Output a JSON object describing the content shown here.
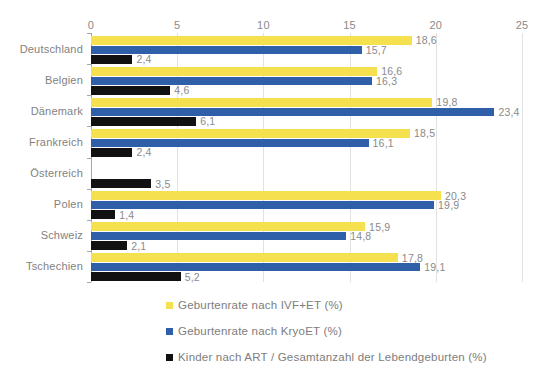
{
  "chart_data": {
    "type": "bar",
    "orientation": "horizontal",
    "title": "",
    "xlabel": "",
    "ylabel": "",
    "xlim": [
      0,
      25
    ],
    "xticks": [
      0,
      5,
      10,
      15,
      20,
      25
    ],
    "xtick_labels": [
      "0",
      "5",
      "10",
      "15",
      "20",
      "25"
    ],
    "grid": true,
    "legend_position": "bottom-left",
    "decimal_separator": ",",
    "categories": [
      "Deutschland",
      "Belgien",
      "Dänemark",
      "Frankreich",
      "Österreich",
      "Polen",
      "Schweiz",
      "Tschechien"
    ],
    "series": [
      {
        "name": "Geburtenrate nach IVF+ET (%)",
        "color": "#f5e04f",
        "values": [
          18.6,
          16.6,
          19.8,
          18.5,
          null,
          20.3,
          15.9,
          17.8
        ],
        "labels": [
          "18,6",
          "16,6",
          "19,8",
          "18,5",
          "",
          "20,3",
          "15,9",
          "17,8"
        ]
      },
      {
        "name": "Geburtenrate nach KryoET (%)",
        "color": "#2e5fa8",
        "values": [
          15.7,
          16.3,
          23.4,
          16.1,
          null,
          19.9,
          14.8,
          19.1
        ],
        "labels": [
          "15,7",
          "16,3",
          "23,4",
          "16,1",
          "",
          "19,9",
          "14,8",
          "19,1"
        ]
      },
      {
        "name": "Kinder nach ART / Gesamtanzahl der Lebendgeburten (%)",
        "color": "#111111",
        "values": [
          2.4,
          4.6,
          6.1,
          2.4,
          3.5,
          1.4,
          2.1,
          5.2
        ],
        "labels": [
          "2,4",
          "4,6",
          "6,1",
          "2,4",
          "3,5",
          "1,4",
          "2,1",
          "5,2"
        ]
      }
    ]
  },
  "colors": {
    "series_yellow": "#f5e04f",
    "series_blue": "#2e5fa8",
    "series_black": "#111111",
    "gridline": "#e2e2e2",
    "axis": "#a6a6a6",
    "text": "#808080",
    "background": "#ffffff"
  }
}
